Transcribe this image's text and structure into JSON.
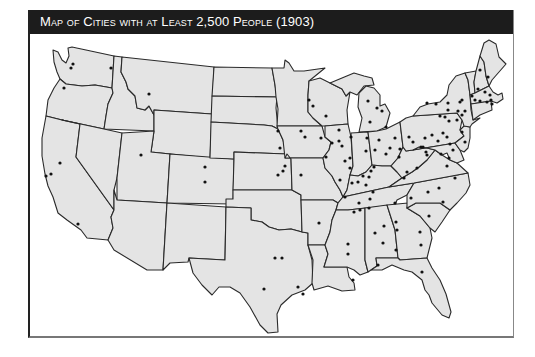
{
  "title": "Map of Cities with at Least 2,500 People (1903)",
  "colors": {
    "title_bg": "#1c1c1c",
    "title_text": "#ffffff",
    "land": "#e4e4e4",
    "border": "#2a2a2a",
    "city_dot": "#111111"
  },
  "legend": {
    "dot": "city with at least 2,500 people"
  },
  "cities": [
    [
      71,
      64
    ],
    [
      69,
      68
    ],
    [
      109,
      68
    ],
    [
      62,
      88
    ],
    [
      147,
      94
    ],
    [
      58,
      163
    ],
    [
      44,
      176
    ],
    [
      49,
      174
    ],
    [
      76,
      224
    ],
    [
      139,
      155
    ],
    [
      203,
      167
    ],
    [
      203,
      182
    ],
    [
      307,
      100
    ],
    [
      311,
      106
    ],
    [
      299,
      131
    ],
    [
      303,
      137
    ],
    [
      324,
      116
    ],
    [
      276,
      131
    ],
    [
      278,
      148
    ],
    [
      283,
      166
    ],
    [
      281,
      171
    ],
    [
      276,
      175
    ],
    [
      299,
      175
    ],
    [
      319,
      138
    ],
    [
      330,
      143
    ],
    [
      324,
      157
    ],
    [
      337,
      141
    ],
    [
      349,
      137
    ],
    [
      348,
      158
    ],
    [
      348,
      168
    ],
    [
      356,
      182
    ],
    [
      361,
      176
    ],
    [
      365,
      138
    ],
    [
      364,
      151
    ],
    [
      369,
      171
    ],
    [
      364,
      185
    ],
    [
      357,
      203
    ],
    [
      358,
      210
    ],
    [
      352,
      212
    ],
    [
      337,
      130
    ],
    [
      340,
      146
    ],
    [
      343,
      161
    ],
    [
      350,
      183
    ],
    [
      343,
      197
    ],
    [
      338,
      180
    ],
    [
      366,
      101
    ],
    [
      375,
      108
    ],
    [
      380,
      111
    ],
    [
      368,
      122
    ],
    [
      384,
      127
    ],
    [
      377,
      140
    ],
    [
      373,
      150
    ],
    [
      384,
      154
    ],
    [
      388,
      148
    ],
    [
      372,
      167
    ],
    [
      367,
      177
    ],
    [
      371,
      192
    ],
    [
      393,
      138
    ],
    [
      398,
      149
    ],
    [
      397,
      157
    ],
    [
      407,
      137
    ],
    [
      411,
      142
    ],
    [
      415,
      168
    ],
    [
      405,
      172
    ],
    [
      402,
      178
    ],
    [
      419,
      147
    ],
    [
      425,
      155
    ],
    [
      423,
      138
    ],
    [
      430,
      135
    ],
    [
      441,
      133
    ],
    [
      421,
      147
    ],
    [
      424,
      152
    ],
    [
      436,
      141
    ],
    [
      445,
      137
    ],
    [
      439,
      154
    ],
    [
      448,
      144
    ],
    [
      447,
      158
    ],
    [
      451,
      150
    ],
    [
      460,
      132
    ],
    [
      463,
      142
    ],
    [
      425,
      103
    ],
    [
      434,
      104
    ],
    [
      446,
      103
    ],
    [
      458,
      102
    ],
    [
      460,
      100
    ],
    [
      446,
      110
    ],
    [
      456,
      111
    ],
    [
      438,
      116
    ],
    [
      443,
      117
    ],
    [
      447,
      121
    ],
    [
      455,
      120
    ],
    [
      460,
      115
    ],
    [
      463,
      111
    ],
    [
      470,
      96
    ],
    [
      478,
      101
    ],
    [
      483,
      92
    ],
    [
      488,
      95
    ],
    [
      489,
      100
    ],
    [
      485,
      102
    ],
    [
      490,
      104
    ],
    [
      476,
      89
    ],
    [
      473,
      100
    ],
    [
      486,
      77
    ],
    [
      478,
      70
    ],
    [
      445,
      166
    ],
    [
      453,
      178
    ],
    [
      437,
      188
    ],
    [
      426,
      192
    ],
    [
      441,
      202
    ],
    [
      368,
      199
    ],
    [
      393,
      203
    ],
    [
      409,
      198
    ],
    [
      395,
      230
    ],
    [
      367,
      208
    ],
    [
      382,
      226
    ],
    [
      373,
      233
    ],
    [
      381,
      243
    ],
    [
      346,
      244
    ],
    [
      346,
      254
    ],
    [
      394,
      222
    ],
    [
      418,
      232
    ],
    [
      427,
      216
    ],
    [
      419,
      245
    ],
    [
      394,
      250
    ],
    [
      376,
      265
    ],
    [
      420,
      272
    ],
    [
      317,
      223
    ],
    [
      351,
      280
    ],
    [
      273,
      258
    ],
    [
      280,
      258
    ],
    [
      262,
      289
    ],
    [
      296,
      287
    ],
    [
      301,
      294
    ]
  ]
}
